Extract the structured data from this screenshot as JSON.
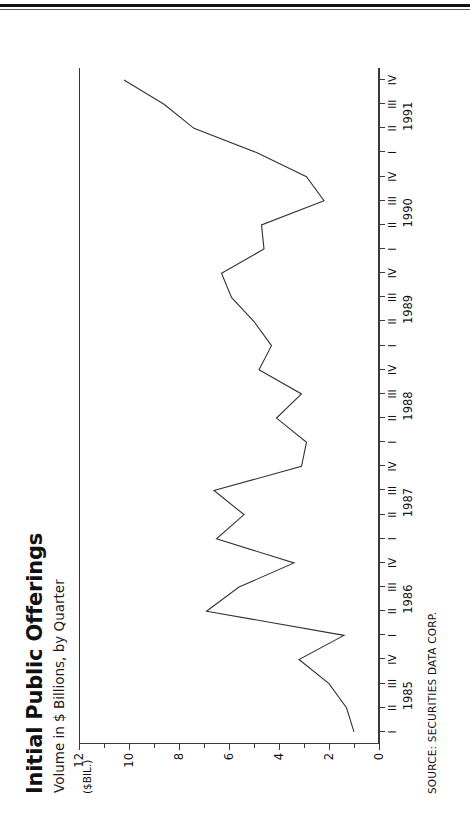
{
  "page": {
    "background": "#ffffff",
    "ink": "#111111"
  },
  "chart_header": {
    "title": "Initial Public Offerings",
    "subtitle": "Volume in $ Billions, by Quarter",
    "unit_label": "($BIL.)",
    "source": "SOURCE: SECURITIES DATA CORP."
  },
  "chart_data": {
    "type": "line",
    "title": "Initial Public Offerings",
    "subtitle": "Volume in $ Billions, by Quarter",
    "xlabel": "",
    "ylabel": "($BIL.)",
    "ylim": [
      0,
      12
    ],
    "ytick_major": [
      0,
      2,
      4,
      6,
      8,
      10,
      12
    ],
    "ytick_minor": [
      1,
      3,
      5,
      7,
      9,
      11
    ],
    "ytick_labels": [
      "0",
      "2",
      "4",
      "6",
      "8",
      "10",
      "12"
    ],
    "grid": false,
    "legend": "none",
    "line_color": "#333333",
    "years": [
      "1985",
      "1986",
      "1987",
      "1988",
      "1989",
      "1990",
      "1991"
    ],
    "quarter_labels": [
      "I",
      "II",
      "III",
      "IV"
    ],
    "categories": [
      "1985 I",
      "1985 II",
      "1985 III",
      "1985 IV",
      "1986 I",
      "1986 II",
      "1986 III",
      "1986 IV",
      "1987 I",
      "1987 II",
      "1987 III",
      "1987 IV",
      "1988 I",
      "1988 II",
      "1988 III",
      "1988 IV",
      "1989 I",
      "1989 II",
      "1989 III",
      "1989 IV",
      "1990 I",
      "1990 II",
      "1990 III",
      "1990 IV",
      "1991 I",
      "1991 II",
      "1991 III",
      "1991 IV"
    ],
    "values": [
      1.0,
      1.3,
      2.0,
      3.2,
      1.4,
      6.9,
      5.6,
      3.4,
      6.5,
      5.4,
      6.6,
      3.1,
      2.9,
      4.1,
      3.1,
      4.8,
      4.3,
      5.0,
      5.9,
      6.3,
      4.6,
      4.7,
      2.2,
      2.9,
      4.9,
      7.4,
      8.6,
      10.2
    ],
    "annotations": []
  },
  "source_note": "SOURCE: SECURITIES DATA CORP."
}
